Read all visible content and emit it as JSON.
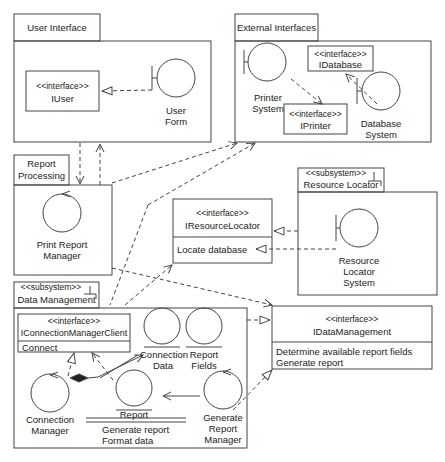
{
  "diagram": {
    "packages": {
      "user_interface": {
        "tab": "User Interface"
      },
      "external_interfaces": {
        "tab": "External Interfaces"
      },
      "report_processing": {
        "tab_line1": "Report",
        "tab_line2": "Processing"
      },
      "resource_locator": {
        "stereotype": "<<subsystem>>",
        "tab": "Resource Locator"
      },
      "data_management": {
        "stereotype": "<<subsystem>>",
        "tab": "Data Management"
      }
    },
    "interfaces": {
      "iuser": {
        "stereotype": "<<interface>>",
        "name": "IUser"
      },
      "idatabase": {
        "stereotype": "<<interface>>",
        "name": "IDatabase"
      },
      "iprinter": {
        "stereotype": "<<interface>>",
        "name": "IPrinter"
      },
      "iresourcelocator": {
        "stereotype": "<<interface>>",
        "name": "IResourceLocator",
        "operations": [
          "Locate database"
        ]
      },
      "idatamanagement": {
        "stereotype": "<<interface>>",
        "name": "IDataManagement",
        "operations": [
          "Determine available report fields",
          "Generate report"
        ]
      },
      "iconnectionmanagerclient": {
        "stereotype": "<<interface>>",
        "name": "IConnectionManagerClient",
        "operations": [
          "Connect"
        ]
      }
    },
    "classes": {
      "user_form": {
        "line1": "User",
        "line2": "Form",
        "kind": "boundary"
      },
      "printer_system": {
        "line1": "Printer",
        "line2": "System",
        "kind": "boundary"
      },
      "database_system": {
        "line1": "Database",
        "line2": "System",
        "kind": "boundary"
      },
      "print_report_manager": {
        "line1": "Print Report",
        "line2": "Manager",
        "kind": "control"
      },
      "resource_locator_system": {
        "line1": "Resource",
        "line2": "Locator",
        "line3": "System",
        "kind": "boundary"
      },
      "connection_data": {
        "line1": "Connection",
        "line2": "Data",
        "kind": "entity"
      },
      "report_fields": {
        "line1": "Report",
        "line2": "Fields",
        "kind": "entity"
      },
      "connection_manager": {
        "line1": "Connection",
        "line2": "Manager",
        "kind": "control"
      },
      "report": {
        "name": "Report",
        "operations": [
          "Generate report",
          "Format data"
        ],
        "kind": "entity"
      },
      "generate_report_manager": {
        "line1": "Generate",
        "line2": "Report",
        "line3": "Manager",
        "kind": "control"
      }
    },
    "colors": {
      "line": "#444444",
      "background": "#ffffff",
      "text": "#222222"
    }
  }
}
